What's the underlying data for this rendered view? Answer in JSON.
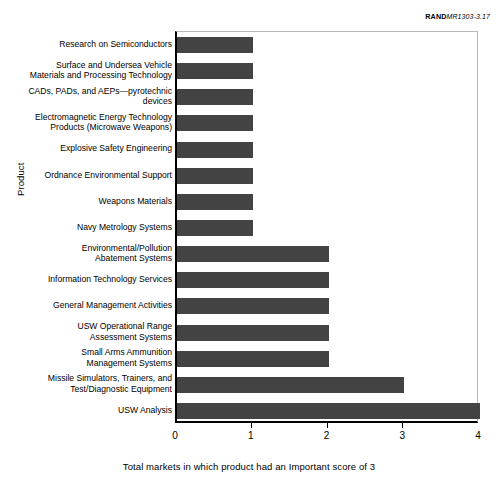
{
  "source_credit": {
    "brand": "RAND",
    "reference": "MR1303-3.17"
  },
  "chart_data": {
    "type": "bar",
    "orientation": "horizontal",
    "title": "",
    "xlabel": "Total markets in which product had an Important score of 3",
    "ylabel": "Product",
    "xlim": [
      0,
      4
    ],
    "xticks": [
      0,
      1,
      2,
      3,
      4
    ],
    "xtick_labels": [
      "0",
      "1",
      "2",
      "3",
      "4"
    ],
    "grid": false,
    "legend": null,
    "bar_color": "#434343",
    "categories": [
      "Research on Semiconductors",
      "Surface and Undersea Vehicle Materials and Processing Technology",
      "CADs, PADs, and AEPs—pyrotechnic devices",
      "Electromagnetic Energy Technology Products (Microwave Weapons)",
      "Explosive Safety Engineering",
      "Ordnance Environmental Support",
      "Weapons Materials",
      "Navy Metrology Systems",
      "Environmental/Pollution Abatement Systems",
      "Information Technology Services",
      "General Management Activities",
      "USW Operational Range Assessment Systems",
      "Small Arms Ammunition Management Systems",
      "Missile Simulators, Trainers, and Test/Diagnostic Equipment",
      "USW Analysis"
    ],
    "category_lines": [
      [
        "Research on Semiconductors"
      ],
      [
        "Surface and Undersea Vehicle",
        "Materials and Processing Technology"
      ],
      [
        "CADs, PADs, and AEPs—pyrotechnic",
        "devices"
      ],
      [
        "Electromagnetic Energy Technology",
        "Products (Microwave Weapons)"
      ],
      [
        "Explosive Safety Engineering"
      ],
      [
        "Ordnance Environmental Support"
      ],
      [
        "Weapons Materials"
      ],
      [
        "Navy Metrology Systems"
      ],
      [
        "Environmental/Pollution",
        "Abatement Systems"
      ],
      [
        "Information Technology Services"
      ],
      [
        "General Management Activities"
      ],
      [
        "USW Operational Range",
        "Assessment Systems"
      ],
      [
        "Small Arms Ammunition",
        "Management Systems"
      ],
      [
        "Missile Simulators, Trainers, and",
        "Test/Diagnostic Equipment"
      ],
      [
        "USW Analysis"
      ]
    ],
    "values": [
      1,
      1,
      1,
      1,
      1,
      1,
      1,
      1,
      2,
      2,
      2,
      2,
      2,
      3,
      4
    ]
  }
}
